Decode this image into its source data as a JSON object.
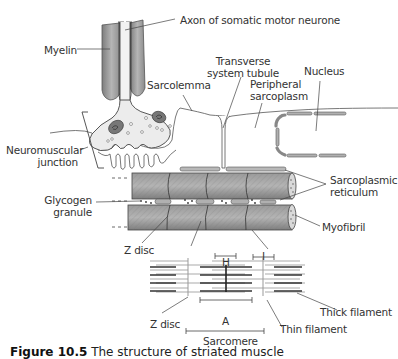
{
  "labels": {
    "axon": "Axon of somatic motor neurone",
    "myelin": "Myelin",
    "sarcolemma": "Sarcolemma",
    "transverse_1": "Transverse",
    "transverse_2": "system tubule",
    "nucleus": "Nucleus",
    "peripheral_1": "Peripheral",
    "peripheral_2": "sarcoplasm",
    "nmj_1": "Neuromuscular",
    "nmj_2": "junction",
    "sr_1": "Sarcoplasmic",
    "sr_2": "reticulum",
    "glycogen_1": "Glycogen",
    "glycogen_2": "granule",
    "myofibril": "Myofibril",
    "z_disc_upper": "Z disc",
    "h_band": "H",
    "i_band": "I",
    "a_band": "A",
    "z_disc_lower": "Z disc",
    "thick_filament": "Thick filament",
    "thin_filament": "Thin filament",
    "sarcomere": "Sarcomere"
  },
  "caption": {
    "figure": "Figure 10.5",
    "text": "The structure of striated muscle"
  },
  "colors": {
    "myofibril_fill": "#8c8c8c",
    "myelin_fill": "#9a9a9a",
    "terminal_fill": "#ececec",
    "line": "#444444",
    "thick_filament": "#333333",
    "thin_filament": "#aaaaaa"
  }
}
